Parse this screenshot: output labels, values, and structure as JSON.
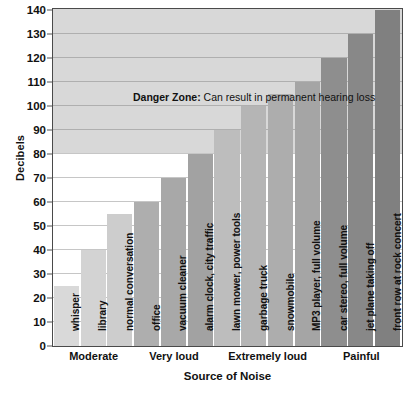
{
  "chart_data": {
    "type": "bar",
    "title": "",
    "xlabel": "Source of Noise",
    "ylabel": "Decibels",
    "ylim": [
      0,
      140
    ],
    "ytick_step": 10,
    "yticks": [
      0,
      10,
      20,
      30,
      40,
      50,
      60,
      70,
      80,
      90,
      100,
      110,
      120,
      130,
      140
    ],
    "grid": true,
    "legend": "none",
    "categories": [
      "whisper",
      "library",
      "normal conversation",
      "office",
      "vacuum cleaner",
      "alarm clock, city traffic",
      "lawn mower, power tools",
      "garbage truck",
      "snowmobile",
      "MP3 player, full volume",
      "car stereo, full volume",
      "jet plane taking off",
      "front row at rock concert"
    ],
    "values": [
      25,
      40,
      55,
      60,
      70,
      80,
      90,
      100,
      105,
      110,
      120,
      130,
      140
    ],
    "bar_colors": [
      "#d9d9d9",
      "#d3d3d3",
      "#cdcdcd",
      "#aeaeae",
      "#a8a8a8",
      "#a2a2a2",
      "#bdbdbd",
      "#b5b5b5",
      "#adadad",
      "#a5a5a5",
      "#8e8e8e",
      "#888888",
      "#808080"
    ],
    "groups": [
      {
        "label": "Moderate",
        "start": 0,
        "count": 3
      },
      {
        "label": "Very loud",
        "start": 3,
        "count": 3
      },
      {
        "label": "Extremely loud",
        "start": 6,
        "count": 4
      },
      {
        "label": "Painful",
        "start": 10,
        "count": 3
      }
    ],
    "annotations": [
      {
        "name": "danger-zone",
        "bold_text": "Danger Zone:",
        "text": " Can result in permanent hearing loss",
        "band_from": 80,
        "band_to": 140,
        "band_color": "#d8d8d8",
        "label_y": 103
      }
    ]
  },
  "axis": {
    "y_title": "Decibels",
    "x_title": "Source of Noise"
  },
  "colors": {
    "plot_border": "#4a4a4a",
    "gridline": "#787878",
    "danger_band": "#d8d8d8",
    "text": "#111111",
    "background": "#ffffff"
  }
}
